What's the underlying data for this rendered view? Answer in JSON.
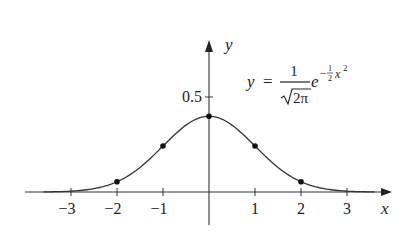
{
  "chart_data": {
    "type": "line",
    "title": "",
    "xlabel": "x",
    "ylabel": "y",
    "function": "y = (1/sqrt(2π)) e^(-x²/2)",
    "annotation": {
      "lhs": "y",
      "equals": "=",
      "numerator": "1",
      "denominator": "2π",
      "base": "e",
      "exponent_sign": "−",
      "exponent_frac_num": "1",
      "exponent_frac_den": "2",
      "exponent_var": "x",
      "exponent_power": "2"
    },
    "x_ticks": [
      -3,
      -2,
      -1,
      1,
      2,
      3
    ],
    "x_tick_labels": [
      "−3",
      "−2",
      "−1",
      "1",
      "2",
      "3"
    ],
    "y_ticks": [
      0.5
    ],
    "y_tick_labels": [
      "0.5"
    ],
    "xlim": [
      -4,
      4
    ],
    "ylim": [
      0,
      0.8
    ],
    "grid": false,
    "legend": null,
    "marked_points": [
      {
        "x": -2,
        "y": 0.054
      },
      {
        "x": -1,
        "y": 0.242
      },
      {
        "x": 0,
        "y": 0.399
      },
      {
        "x": 1,
        "y": 0.242
      },
      {
        "x": 2,
        "y": 0.054
      }
    ],
    "series": [
      {
        "name": "standard normal density",
        "x": [
          -4,
          -3.5,
          -3,
          -2.5,
          -2,
          -1.5,
          -1,
          -0.5,
          0,
          0.5,
          1,
          1.5,
          2,
          2.5,
          3,
          3.5,
          4
        ],
        "values": [
          0.0001,
          0.0009,
          0.0044,
          0.0175,
          0.054,
          0.1295,
          0.242,
          0.3521,
          0.3989,
          0.3521,
          0.242,
          0.1295,
          0.054,
          0.0175,
          0.0044,
          0.0009,
          0.0001
        ]
      }
    ]
  }
}
